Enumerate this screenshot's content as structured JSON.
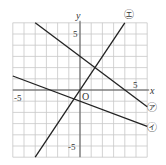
{
  "chart_data": {
    "type": "line",
    "title": "",
    "xlabel": "x",
    "ylabel": "y",
    "xlim": [
      -6,
      6
    ],
    "ylim": [
      -6,
      6
    ],
    "grid": true,
    "grid_step": 1,
    "origin_label": "O",
    "tick_labels": {
      "x": [
        {
          "value": -5,
          "label": "-5"
        },
        {
          "value": 5,
          "label": "5"
        }
      ],
      "y": [
        {
          "value": 5,
          "label": "5"
        },
        {
          "value": -5,
          "label": "-5"
        }
      ]
    },
    "series": [
      {
        "name": "㋐",
        "slope": -0.75,
        "intercept": 3,
        "from": [
          -4,
          6
        ],
        "to": [
          6,
          -1.5
        ]
      },
      {
        "name": "㋑",
        "slope": -0.375,
        "intercept": -1,
        "from": [
          -6,
          1.25
        ],
        "to": [
          6,
          -3.25
        ]
      },
      {
        "name": "㋓",
        "slope": 1.5,
        "intercept": 0,
        "from": [
          -4,
          -6
        ],
        "to": [
          4,
          6
        ]
      }
    ]
  },
  "labels": {
    "x_axis": "x",
    "y_axis": "y",
    "origin": "O",
    "x_tick_neg": "-5",
    "x_tick_pos": "5",
    "y_tick_pos": "5",
    "y_tick_neg": "-5",
    "line_a": "㋐",
    "line_b": "㋑",
    "line_d": "㋓"
  },
  "colors": {
    "grid": "#c8c8c8",
    "axis": "#555555",
    "line": "#222222"
  }
}
